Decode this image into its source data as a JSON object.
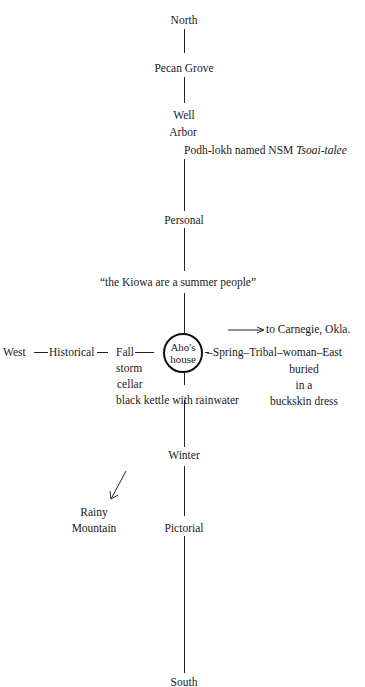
{
  "diagram": {
    "center": {
      "line1": "Aho's",
      "line2": "house"
    },
    "north_axis": {
      "north": "North",
      "pecan_grove": "Pecan Grove",
      "well": "Well",
      "arbor": "Arbor",
      "naming_prefix": "Podh-lokh named NSM ",
      "naming_name": "Tsoai-talee",
      "personal": "Personal",
      "quote": "“the Kiowa are a summer people”"
    },
    "west_axis": {
      "west": "West",
      "historical": "Historical",
      "fall": "Fall",
      "storm": "storm",
      "cellar": "cellar",
      "kettle": "black kettle with rainwater"
    },
    "east_axis": {
      "carnegie": "to Carnegie, Okla.",
      "spring": "Spring",
      "tribal": "Tribal",
      "woman": "woman",
      "east": "East",
      "buried": "buried",
      "in_a": "in a",
      "buckskin": "buckskin dress"
    },
    "south_axis": {
      "winter": "Winter",
      "rainy": "Rainy",
      "mountain": "Mountain",
      "pictorial": "Pictorial",
      "south": "South"
    }
  }
}
